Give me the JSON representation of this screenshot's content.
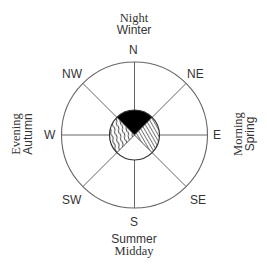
{
  "diagram": {
    "type": "compass-rose-time-season",
    "directions": {
      "n": "N",
      "ne": "NE",
      "e": "E",
      "se": "SE",
      "s": "S",
      "sw": "SW",
      "w": "W",
      "nw": "NW"
    },
    "captions": {
      "north": {
        "line1": "Night",
        "line2": "Winter"
      },
      "east": {
        "line1": "Morning",
        "line2": "Spring"
      },
      "south": {
        "line1": "Summer",
        "line2": "Midday"
      },
      "west": {
        "line1": "Evening",
        "line2": "Autumn"
      }
    },
    "inner_quadrants": [
      {
        "position": "top",
        "fill": "solid-black",
        "color": "#000000"
      },
      {
        "position": "right",
        "fill": "diagonal-hatch",
        "color": "#555555"
      },
      {
        "position": "bottom",
        "fill": "white-stipple",
        "color": "#ffffff"
      },
      {
        "position": "left",
        "fill": "wavy-hatch",
        "color": "#444444"
      }
    ],
    "colors": {
      "line": "#555555",
      "text": "#333333",
      "background": "#ffffff"
    }
  }
}
